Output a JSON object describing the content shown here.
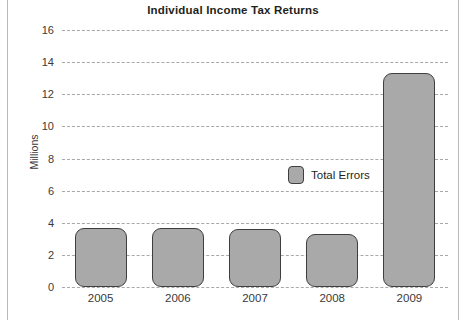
{
  "chart_data": {
    "type": "bar",
    "title": "Individual Income Tax Returns",
    "xlabel": "",
    "ylabel": "Millions",
    "categories": [
      "2005",
      "2006",
      "2007",
      "2008",
      "2009"
    ],
    "series": [
      {
        "name": "Total Errors",
        "values": [
          3.7,
          3.7,
          3.6,
          3.3,
          13.3
        ]
      }
    ],
    "ylim": [
      0,
      16
    ],
    "yticks": [
      0,
      2,
      4,
      6,
      8,
      10,
      12,
      14,
      16
    ],
    "ytick_labels": [
      "0",
      "2",
      "4",
      "6",
      "8",
      "10",
      "12",
      "14",
      "16"
    ],
    "grid": true,
    "grid_style": "dashed-horizontal",
    "legend": {
      "position": "inside-center",
      "entries": [
        "Total Errors"
      ]
    },
    "colors": {
      "bar_fill": "#a9a9a9",
      "bar_border": "#3f3f3f",
      "gridline": "#9a9a9a",
      "text": "#231f20",
      "background": "#ffffff"
    }
  }
}
